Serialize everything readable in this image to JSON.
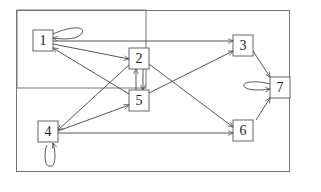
{
  "diagram": {
    "type": "directed-graph",
    "frame": {
      "x": 17,
      "y": 10,
      "w": 128,
      "h": 77
    },
    "nodes": [
      {
        "id": "1",
        "label": "1",
        "x": 33,
        "y": 30,
        "w": 20,
        "h": 21
      },
      {
        "id": "2",
        "label": "2",
        "x": 129,
        "y": 48,
        "w": 20,
        "h": 21
      },
      {
        "id": "3",
        "label": "3",
        "x": 233,
        "y": 35,
        "w": 20,
        "h": 21
      },
      {
        "id": "4",
        "label": "4",
        "x": 38,
        "y": 121,
        "w": 20,
        "h": 21
      },
      {
        "id": "5",
        "label": "5",
        "x": 129,
        "y": 90,
        "w": 20,
        "h": 21
      },
      {
        "id": "6",
        "label": "6",
        "x": 233,
        "y": 120,
        "w": 20,
        "h": 21
      },
      {
        "id": "7",
        "label": "7",
        "x": 270,
        "y": 77,
        "w": 20,
        "h": 21
      }
    ],
    "edges": [
      {
        "from": "1",
        "to": "1",
        "kind": "self-loop"
      },
      {
        "from": "1",
        "to": "2"
      },
      {
        "from": "1",
        "to": "3"
      },
      {
        "from": "5",
        "to": "1"
      },
      {
        "from": "2",
        "to": "5"
      },
      {
        "from": "5",
        "to": "2"
      },
      {
        "from": "2",
        "to": "4"
      },
      {
        "from": "2",
        "to": "6"
      },
      {
        "from": "4",
        "to": "5"
      },
      {
        "from": "4",
        "to": "6"
      },
      {
        "from": "4",
        "to": "4",
        "kind": "self-loop"
      },
      {
        "from": "5",
        "to": "3"
      },
      {
        "from": "3",
        "to": "7"
      },
      {
        "from": "6",
        "to": "7"
      },
      {
        "from": "7",
        "to": "7",
        "kind": "self-loop"
      }
    ]
  }
}
